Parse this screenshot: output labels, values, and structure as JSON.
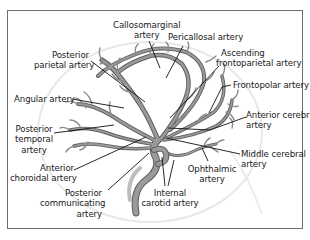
{
  "diagram": {
    "colors": {
      "vessel_fill": "#9a9a9a",
      "vessel_outline": "#5e5e5e",
      "leader_line": "#111111",
      "outline_circle": "#e6e6e6",
      "frame": "#6e6e6e",
      "text": "#1a1a1a"
    },
    "labels": {
      "callosomarginal": [
        "Callosomarginal",
        "artery"
      ],
      "pericallosal": [
        "Pericallosal artery"
      ],
      "posterior_parietal": [
        "Posterior",
        "parietal artery"
      ],
      "ascending_frontoparietal": [
        "Ascending",
        "frontoparietal artery"
      ],
      "frontopolar": [
        "Frontopolar artery"
      ],
      "angular": [
        "Angular artery"
      ],
      "anterior_cerebral": [
        "Anterior cerebral",
        "artery"
      ],
      "posterior_temporal": [
        "Posterior",
        "temporal",
        "artery"
      ],
      "middle_cerebral": [
        "Middle cerebral",
        "artery"
      ],
      "anterior_choroidal": [
        "Anterior",
        "choroidal artery"
      ],
      "ophthalmic": [
        "Ophthalmic",
        "artery"
      ],
      "posterior_communicating": [
        "Posterior",
        "communicating",
        "artery"
      ],
      "internal_carotid": [
        "Internal",
        "carotid artery"
      ]
    }
  }
}
